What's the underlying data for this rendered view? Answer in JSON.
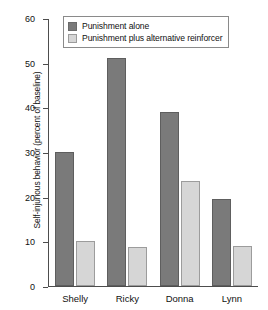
{
  "chart_data": {
    "type": "bar",
    "title": "",
    "xlabel": "",
    "ylabel": "Self-injurious behavior (percent of baseline)",
    "categories": [
      "Shelly",
      "Ricky",
      "Donna",
      "Lynn"
    ],
    "series": [
      {
        "name": "Punishment alone",
        "values": [
          30,
          51,
          39,
          19.5
        ],
        "color": "#7a7a7a"
      },
      {
        "name": "Punishment plus alternative reinforcer",
        "values": [
          10,
          8.7,
          23.5,
          9
        ],
        "color": "#d6d6d6"
      }
    ],
    "ylim": [
      0,
      60
    ],
    "yticks": [
      0,
      10,
      20,
      30,
      40,
      50,
      60
    ],
    "ytick_labels": [
      "0",
      "10",
      "20",
      "30",
      "40",
      "50",
      "60"
    ],
    "grid": false,
    "legend_position": "top-center"
  }
}
